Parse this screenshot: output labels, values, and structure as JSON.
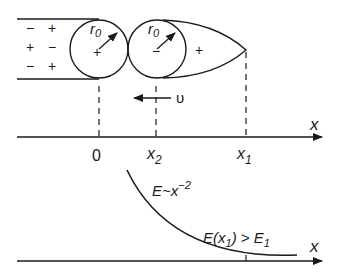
{
  "diagram": {
    "channel_charges": {
      "row1": [
        "−",
        "+"
      ],
      "row2": [
        "+",
        "−"
      ],
      "row3": [
        "−",
        "+"
      ]
    },
    "circle1": {
      "radius_label": "r",
      "radius_sub": "0",
      "center_mark": "+"
    },
    "circle2": {
      "radius_label": "r",
      "radius_sub": "0",
      "center_mark": "−"
    },
    "tail_charge": "+",
    "velocity_label": "υ",
    "upper_axis": {
      "axis_label": "x",
      "ticks": [
        {
          "label": "0",
          "sub": ""
        },
        {
          "label": "x",
          "sub": "2"
        },
        {
          "label": "x",
          "sub": "1"
        }
      ]
    },
    "lower_plot": {
      "axis_label": "x",
      "curve_label_main": "E~x",
      "curve_label_exp": "−2",
      "condition_label_a": "E(x",
      "condition_label_sub": "1",
      "condition_label_b": ") > E",
      "condition_label_sub2": "1"
    },
    "colors": {
      "ink": "#1a1a1a",
      "background": "#ffffff"
    }
  }
}
